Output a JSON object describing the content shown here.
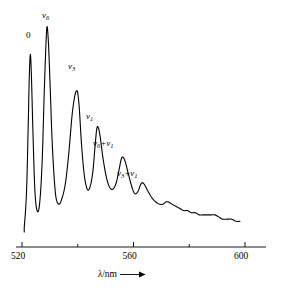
{
  "figure": {
    "kind": "emission-spectrum-plot",
    "line_color": "#000000",
    "axis_color": "#000000",
    "background": "#ffffff"
  },
  "axis": {
    "title_symbol": "λ",
    "title_unit": "/nm",
    "arrow_icon": "right-arrow-icon",
    "tick_values": [
      520,
      540,
      560,
      580,
      600
    ],
    "labeled_ticks": [
      "520",
      "560",
      "600"
    ],
    "x_min": 518,
    "x_max": 604
  },
  "peak_labels": [
    {
      "id": "origin",
      "text": "0",
      "italic": false,
      "sub": "",
      "x": 26,
      "y": 31
    },
    {
      "id": "nu6",
      "text": "ν",
      "italic": true,
      "sub": "6",
      "x": 42,
      "y": 11
    },
    {
      "id": "nu3",
      "text": "ν",
      "italic": true,
      "sub": "3",
      "x": 68,
      "y": 62
    },
    {
      "id": "nu1",
      "text": "ν",
      "italic": true,
      "sub": "1",
      "x": 86,
      "y": 112
    },
    {
      "id": "nu6-plus-nu1",
      "text": "ν",
      "italic": true,
      "sub": "6",
      "text2": "+ν",
      "sub2": "1",
      "x": 93,
      "y": 139
    },
    {
      "id": "nu3-plus-nu1",
      "text": "ν",
      "italic": true,
      "sub": "3",
      "text2": "+ν",
      "sub2": "1",
      "x": 117,
      "y": 169
    }
  ],
  "chart_data": {
    "type": "line",
    "title": "",
    "xlabel": "λ/nm",
    "ylabel": "",
    "xlim": [
      518,
      604
    ],
    "ylim": [
      0,
      100
    ],
    "grid": false,
    "legend": null,
    "xticks": [
      520,
      540,
      560,
      580,
      600
    ],
    "xticklabels": [
      "520",
      "",
      "560",
      "",
      "600"
    ],
    "annotations": [
      {
        "label": "0",
        "x": 523.0,
        "y": 83
      },
      {
        "label": "ν6",
        "x": 529.0,
        "y": 96
      },
      {
        "label": "ν3",
        "x": 540.0,
        "y": 66
      },
      {
        "label": "ν1",
        "x": 546.8,
        "y": 49
      },
      {
        "label": "ν6+ν1",
        "x": 555.6,
        "y": 35
      },
      {
        "label": "ν3+ν1",
        "x": 562.5,
        "y": 23
      }
    ],
    "series": [
      {
        "name": "emission intensity",
        "x": [
          520.8,
          521.6,
          522.2,
          522.6,
          523.0,
          523.4,
          523.9,
          524.6,
          525.4,
          526.3,
          527.2,
          528.0,
          528.6,
          529.0,
          529.5,
          530.1,
          530.9,
          532.0,
          533.2,
          534.4,
          535.6,
          536.8,
          538.0,
          539.0,
          539.7,
          540.1,
          540.6,
          541.3,
          542.3,
          543.4,
          544.4,
          545.4,
          546.2,
          546.8,
          547.3,
          548.0,
          549.0,
          550.2,
          551.4,
          552.6,
          553.8,
          554.8,
          555.6,
          556.2,
          557.0,
          558.0,
          559.2,
          560.4,
          561.6,
          562.5,
          563.2,
          564.0,
          565.2,
          566.6,
          568.0,
          569.4,
          570.6,
          571.6,
          572.6,
          573.8,
          575.2,
          576.6,
          578.0,
          579.4,
          580.8,
          582.2,
          583.6,
          585.0,
          586.4,
          587.8,
          589.2,
          590.6,
          592.0,
          593.6,
          595.2,
          596.8,
          598.2
        ],
        "y": [
          2,
          18,
          48,
          72,
          83,
          72,
          48,
          20,
          10,
          13,
          32,
          66,
          88,
          96,
          88,
          68,
          40,
          18,
          13,
          16,
          23,
          37,
          55,
          64,
          66,
          64,
          57,
          42,
          27,
          20,
          21,
          28,
          40,
          48,
          49,
          45,
          35,
          26,
          21,
          20,
          23,
          29,
          34,
          35,
          33,
          28,
          22,
          18,
          19,
          22,
          23,
          22,
          19,
          16,
          14,
          13,
          13,
          14,
          14,
          13,
          12,
          11,
          10,
          10,
          9,
          9,
          8,
          8,
          8,
          8,
          8,
          7,
          6,
          6,
          6,
          5,
          5
        ]
      }
    ]
  }
}
